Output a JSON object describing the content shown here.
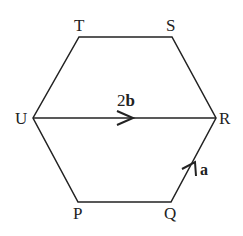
{
  "diagram": {
    "shape": "regular hexagon",
    "vertices": {
      "T": "T",
      "S": "S",
      "R": "R",
      "Q": "Q",
      "P": "P",
      "U": "U"
    },
    "vectors": {
      "UR": {
        "coef": "2",
        "symbol": "b"
      },
      "QR": {
        "coef": "",
        "symbol": "a"
      }
    },
    "line_color": "#222222"
  }
}
